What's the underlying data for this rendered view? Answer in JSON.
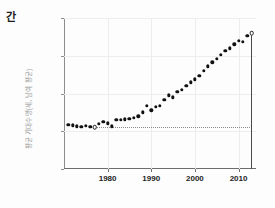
{
  "corner": {
    "text": "간"
  },
  "axes": {
    "ylabel": "평균 기대수명(세, 남여 평균)",
    "ytick_labels": [
      "80",
      "60",
      "40",
      "20",
      "0"
    ],
    "xtick_labels": [
      "1980",
      "1990",
      "2000",
      "2010"
    ]
  },
  "colors": {
    "point": "#111111",
    "grid": "#eceded",
    "axis": "#6d6d6d",
    "reference": "#8a8a8a",
    "vline": "#4a4a4a",
    "ylabel_text": "#9a9a9a"
  },
  "chart_data": {
    "type": "scatter",
    "title": "",
    "xlabel": "",
    "ylabel": "평균 기대수명(세, 남여 평균)",
    "xlim": [
      1970,
      2014
    ],
    "ylim": [
      0,
      80
    ],
    "xticks": [
      1980,
      1990,
      2000,
      2010
    ],
    "yticks": [
      0,
      20,
      40,
      60,
      80
    ],
    "grid": true,
    "legend": "none",
    "x": [
      1971,
      1972,
      1973,
      1974,
      1975,
      1976,
      1977,
      1978,
      1979,
      1980,
      1981,
      1982,
      1983,
      1984,
      1985,
      1986,
      1987,
      1988,
      1989,
      1990,
      1991,
      1992,
      1993,
      1994,
      1995,
      1996,
      1997,
      1998,
      1999,
      2000,
      2001,
      2002,
      2003,
      2004,
      2005,
      2006,
      2007,
      2008,
      2009,
      2010,
      2011,
      2012,
      2013
    ],
    "values": [
      23.5,
      23.2,
      22.6,
      22.4,
      22.8,
      22.5,
      22.0,
      24.0,
      25.0,
      24.3,
      22.7,
      26.2,
      26.0,
      26.3,
      26.5,
      27.0,
      28.0,
      30.0,
      33.5,
      31.0,
      33.0,
      33.5,
      36.5,
      39.0,
      38.0,
      41.0,
      42.0,
      44.0,
      46.0,
      47.5,
      49.5,
      52.0,
      54.5,
      56.5,
      58.5,
      60.5,
      62.5,
      64.0,
      66.0,
      68.0,
      67.5,
      70.5,
      72.0
    ],
    "annotations": [
      {
        "name": "reference-point",
        "x": 1977,
        "y": 22.0,
        "style": "open-circle"
      },
      {
        "name": "endpoint-marker",
        "x": 2013,
        "y": 72.0,
        "style": "open-circle"
      },
      {
        "name": "reference-line",
        "y": 22.0,
        "x_from": 1977,
        "x_to": 2013,
        "style": "dotted"
      },
      {
        "name": "vertical-line",
        "x": 2013,
        "y_from": 0,
        "y_to": 72.0,
        "style": "solid"
      }
    ]
  }
}
